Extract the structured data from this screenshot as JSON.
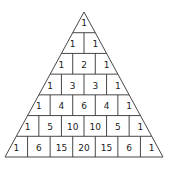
{
  "rows": [
    [
      1
    ],
    [
      1,
      1
    ],
    [
      1,
      2,
      1
    ],
    [
      1,
      3,
      3,
      1
    ],
    [
      1,
      4,
      6,
      4,
      1
    ],
    [
      1,
      5,
      10,
      10,
      5,
      1
    ],
    [
      1,
      6,
      15,
      20,
      15,
      6,
      1
    ]
  ],
  "colors": {
    "line": "#333333",
    "text": "#222222",
    "background": "#ffffff"
  }
}
